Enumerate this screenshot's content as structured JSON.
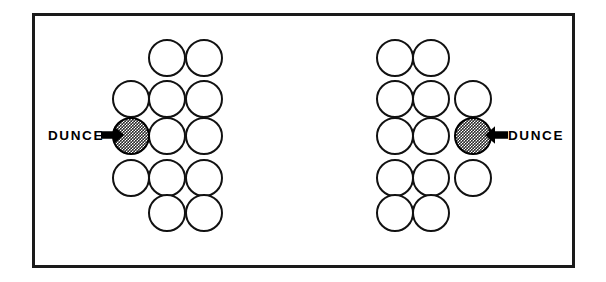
{
  "figure": {
    "background_color": "#ffffff",
    "frame": {
      "border_color": "#1a1a1a",
      "border_width_px": 3,
      "x": 32,
      "y": 13,
      "width": 543,
      "height": 255
    },
    "circle": {
      "diameter_px": 38,
      "outline_color": "#111111",
      "outline_width_px": 2.6,
      "fill_empty": "#ffffff",
      "fill_shaded": "#2b2b2b",
      "shaded_pattern": "checkerboard-halftone"
    },
    "clusters": [
      {
        "id": "left-cluster",
        "name": "left-circle-cluster",
        "orientation": "dunce-on-left",
        "columns": [
          {
            "index": 1,
            "cx": 132,
            "rows": [
              2,
              3,
              4
            ]
          },
          {
            "index": 2,
            "cx": 178,
            "rows": [
              1,
              2,
              3,
              4,
              5
            ]
          },
          {
            "index": 3,
            "cx": 214,
            "rows": [
              1,
              2,
              3,
              4,
              5
            ]
          }
        ],
        "row_cy": {
          "1": 55,
          "2": 96,
          "3": 133,
          "4": 175,
          "5": 210
        },
        "shaded_circle": {
          "column": 1,
          "row": 3,
          "cx": 132,
          "cy": 133
        },
        "label": {
          "text": "DUNCE",
          "x": 48,
          "y": 126,
          "arrow_direction": "right",
          "arrow_x": 103,
          "arrow_y": 124
        }
      },
      {
        "id": "right-cluster",
        "name": "right-circle-cluster",
        "orientation": "dunce-on-right",
        "columns": [
          {
            "index": 1,
            "cx": 392,
            "rows": [
              1,
              2,
              3,
              4,
              5
            ]
          },
          {
            "index": 2,
            "cx": 428,
            "rows": [
              1,
              2,
              3,
              4,
              5
            ]
          },
          {
            "index": 3,
            "cx": 470,
            "rows": [
              2,
              3,
              4
            ]
          }
        ],
        "row_cy": {
          "1": 55,
          "2": 96,
          "3": 133,
          "4": 175,
          "5": 210
        },
        "shaded_circle": {
          "column": 3,
          "row": 3,
          "cx": 470,
          "cy": 133
        },
        "label": {
          "text": "DUNCE",
          "x": 508,
          "y": 126,
          "arrow_direction": "left",
          "arrow_x": 487,
          "arrow_y": 124
        }
      }
    ],
    "labels": {
      "left_dunce": "DUNCE",
      "right_dunce": "DUNCE"
    }
  }
}
